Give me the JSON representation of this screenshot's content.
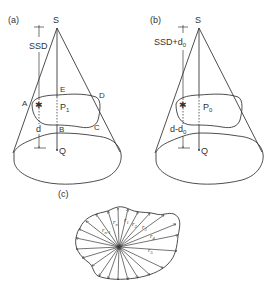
{
  "panels": {
    "a": {
      "label": "(a)",
      "source": "S",
      "distance_label": "SSD",
      "depth_label": "d",
      "point_label": "P",
      "point_sub": "1",
      "depth_point": "Q",
      "corners": {
        "A": "A",
        "B": "B",
        "C": "C",
        "D": "D",
        "E": "E"
      }
    },
    "b": {
      "label": "(b)",
      "source": "S",
      "distance_label": "SSD+d",
      "distance_sub": "0",
      "depth_label": "d-d",
      "depth_sub": "0",
      "point_label": "P",
      "point_sub": "0",
      "depth_point": "Q"
    },
    "c": {
      "label": "(c)",
      "radii": [
        {
          "label": "r",
          "sub": "n-1"
        },
        {
          "label": "r",
          "sub": "n"
        },
        {
          "label": "r",
          "sub": "1"
        },
        {
          "label": "r",
          "sub": "2"
        },
        {
          "label": "r",
          "sub": "3"
        },
        {
          "label": "r",
          "sub": "4"
        },
        {
          "label": "r",
          "sub": "5"
        }
      ]
    }
  }
}
